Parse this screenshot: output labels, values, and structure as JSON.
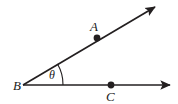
{
  "figure": {
    "kind": "geometry-angle-diagram",
    "background_color": "#ffffff",
    "stroke_color": "#231f20",
    "labels": {
      "point_a": "A",
      "point_b": "B",
      "point_c": "C",
      "angle": "θ"
    },
    "points": {
      "vertex_b": {
        "x": 23,
        "y": 85
      },
      "point_a": {
        "x": 97,
        "y": 38
      },
      "point_c": {
        "x": 111,
        "y": 85
      }
    },
    "rays": [
      {
        "name": "ray-ba",
        "from": {
          "x": 23,
          "y": 85
        },
        "to": {
          "x": 157,
          "y": 6
        },
        "arrowhead": "end",
        "passes_through_point": "A"
      },
      {
        "name": "ray-bc",
        "from": {
          "x": 23,
          "y": 85
        },
        "to": {
          "x": 173,
          "y": 85
        },
        "arrowhead": "end",
        "passes_through_point": "C"
      }
    ],
    "angle_arc": {
      "center": {
        "x": 23,
        "y": 85
      },
      "radius": 40,
      "start_deg": 0,
      "end_deg": 30.5
    }
  }
}
